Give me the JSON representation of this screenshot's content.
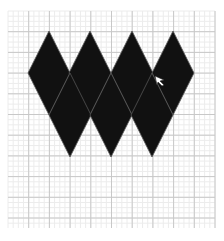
{
  "canvas": {
    "width": 224,
    "height": 241,
    "background": "#ffffff"
  },
  "grid": {
    "x0": 8,
    "y0": 11,
    "x1": 215,
    "y1": 228,
    "major_spacing": 20.7,
    "minor_divisions": 4,
    "major_color": "#c8c8c8",
    "minor_color": "#ececec"
  },
  "shapes": {
    "fill": "#111111",
    "edge_color": "#555555",
    "top_row": [
      {
        "cx": 49,
        "cy": 73,
        "hw": 21,
        "hh": 42
      },
      {
        "cx": 90,
        "cy": 73,
        "hw": 21,
        "hh": 42
      },
      {
        "cx": 132,
        "cy": 73,
        "hw": 21,
        "hh": 42
      },
      {
        "cx": 173,
        "cy": 73,
        "hw": 21,
        "hh": 42
      }
    ],
    "bottom_row": [
      {
        "cx": 70,
        "cy": 115,
        "hw": 21,
        "hh": 42
      },
      {
        "cx": 111,
        "cy": 115,
        "hw": 21,
        "hh": 42
      },
      {
        "cx": 152,
        "cy": 115,
        "hw": 21,
        "hh": 42
      }
    ]
  },
  "cursor": {
    "x": 155,
    "y": 76
  }
}
